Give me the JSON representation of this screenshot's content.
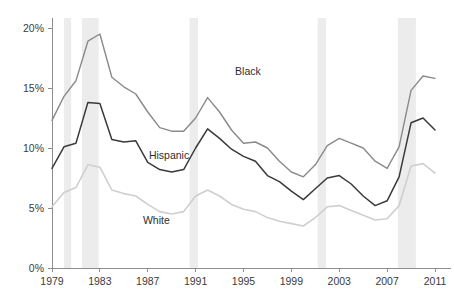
{
  "chart_data": {
    "type": "line",
    "title": "",
    "subtitle": "",
    "xlabel": "",
    "ylabel": "",
    "xlim": [
      1979,
      2011
    ],
    "ylim": [
      0,
      20
    ],
    "grid": false,
    "legend_position": "inline-annotations",
    "x": [
      1979,
      1980,
      1981,
      1982,
      1983,
      1984,
      1985,
      1986,
      1987,
      1988,
      1989,
      1990,
      1991,
      1992,
      1993,
      1994,
      1995,
      1996,
      1997,
      1998,
      1999,
      2000,
      2001,
      2002,
      2003,
      2004,
      2005,
      2006,
      2007,
      2008,
      2009,
      2010,
      2011
    ],
    "x_tick_labels": [
      "1979",
      "1983",
      "1987",
      "1991",
      "1995",
      "1999",
      "2003",
      "2007",
      "2011"
    ],
    "x_ticks": [
      1979,
      1983,
      1987,
      1991,
      1995,
      1999,
      2003,
      2007,
      2011
    ],
    "y_ticks": [
      0,
      5,
      10,
      15,
      20
    ],
    "y_tick_labels": [
      "0%",
      "5%",
      "10%",
      "15%",
      "20%"
    ],
    "series": [
      {
        "name": "Black",
        "label": "Black",
        "color": "#8a8a8a",
        "stroke_width": 1.4,
        "label_x": 1994.3,
        "label_y": 16.1,
        "values": [
          12.3,
          14.3,
          15.6,
          18.9,
          19.5,
          15.9,
          15.1,
          14.5,
          13.0,
          11.7,
          11.4,
          11.4,
          12.5,
          14.2,
          13.0,
          11.5,
          10.4,
          10.5,
          10.0,
          8.9,
          8.0,
          7.6,
          8.6,
          10.2,
          10.8,
          10.4,
          10.0,
          8.9,
          8.3,
          10.1,
          14.8,
          16.0,
          15.8
        ]
      },
      {
        "name": "Hispanic",
        "label": "Hispanic",
        "color": "#3a3a3a",
        "stroke_width": 1.5,
        "label_x": 1987.1,
        "label_y": 9.1,
        "values": [
          8.3,
          10.1,
          10.4,
          13.8,
          13.7,
          10.7,
          10.5,
          10.6,
          8.8,
          8.2,
          8.0,
          8.2,
          10.0,
          11.6,
          10.8,
          9.9,
          9.3,
          8.9,
          7.7,
          7.2,
          6.4,
          5.7,
          6.6,
          7.5,
          7.7,
          7.0,
          6.0,
          5.2,
          5.6,
          7.6,
          12.1,
          12.5,
          11.5
        ]
      },
      {
        "name": "White",
        "label": "White",
        "color": "#cfcfcf",
        "stroke_width": 1.6,
        "label_x": 1986.6,
        "label_y": 3.7,
        "values": [
          5.1,
          6.3,
          6.7,
          8.6,
          8.4,
          6.5,
          6.2,
          6.0,
          5.3,
          4.7,
          4.5,
          4.7,
          6.0,
          6.5,
          6.0,
          5.3,
          4.9,
          4.7,
          4.2,
          3.9,
          3.7,
          3.5,
          4.2,
          5.1,
          5.2,
          4.8,
          4.4,
          4.0,
          4.1,
          5.2,
          8.5,
          8.7,
          7.9
        ]
      }
    ],
    "recession_bands": [
      {
        "name": "recession-1980",
        "start": 1980.0,
        "end": 1980.6
      },
      {
        "name": "recession-1981-1982",
        "start": 1981.5,
        "end": 1982.9
      },
      {
        "name": "recession-1990-1991",
        "start": 1990.5,
        "end": 1991.2
      },
      {
        "name": "recession-2001",
        "start": 2001.2,
        "end": 2001.9
      },
      {
        "name": "recession-2007-2009",
        "start": 2007.9,
        "end": 2009.4
      }
    ],
    "colors": {
      "black_series": "#8a8a8a",
      "hispanic_series": "#3a3a3a",
      "white_series": "#cfcfcf",
      "recession_band": "#ececec",
      "axis": "#8d8d8d",
      "text": "#3b3b3b",
      "background": "#ffffff"
    }
  }
}
